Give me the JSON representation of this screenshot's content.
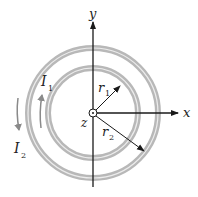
{
  "diagram": {
    "axes": {
      "x_label": "x",
      "y_label": "y",
      "z_label": "z"
    },
    "loops": [
      {
        "name": "inner",
        "current_label": "I",
        "current_sub": "1",
        "radius_label": "r",
        "radius_sub": "1",
        "direction": "counterclockwise"
      },
      {
        "name": "outer",
        "current_label": "I",
        "current_sub": "2",
        "radius_label": "r",
        "radius_sub": "2",
        "direction": "clockwise"
      }
    ],
    "colors": {
      "ring": "#b8b8b8",
      "ring_inner_line": "#e6e6e6",
      "axis": "#1a1a1a",
      "current_arrow": "#8a8a8a"
    }
  }
}
